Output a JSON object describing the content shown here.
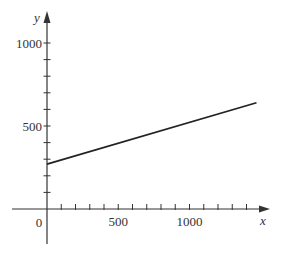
{
  "chart_data": {
    "type": "line",
    "title": "",
    "xlabel": "x",
    "ylabel": "y",
    "xlim": [
      -100,
      1550
    ],
    "ylim": [
      -150,
      1100
    ],
    "x_ticks_major": [
      500,
      1000
    ],
    "x_tick_labels": [
      "500",
      "1000"
    ],
    "x_minor_step": 100,
    "y_ticks_major": [
      500,
      1000
    ],
    "y_tick_labels": [
      "500",
      "1000"
    ],
    "y_minor_step": 100,
    "origin_label": "0",
    "grid": false,
    "legend": null,
    "series": [
      {
        "name": "line",
        "x": [
          0,
          1470
        ],
        "y": [
          270,
          640
        ],
        "color": "#222222"
      }
    ]
  }
}
